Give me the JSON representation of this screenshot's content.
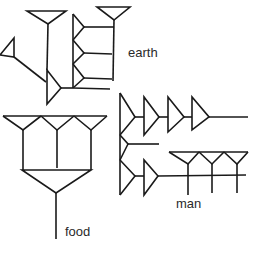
{
  "diagram": {
    "stroke_color": "#1a1a1a",
    "background": "#ffffff",
    "signs": [
      {
        "id": "earth",
        "label": "earth"
      },
      {
        "id": "man",
        "label": "man"
      },
      {
        "id": "food",
        "label": "food"
      }
    ]
  }
}
